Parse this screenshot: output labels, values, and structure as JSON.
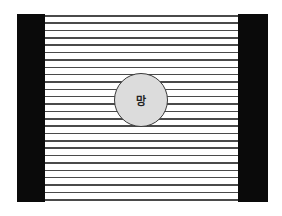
{
  "diagram": {
    "center_label": "망",
    "line_count": 26,
    "colors": {
      "bar": "#0a0a0a",
      "line": "#4a4a4a",
      "circle_fill": "#dcdcdc",
      "circle_stroke": "#3a3a3a"
    }
  }
}
